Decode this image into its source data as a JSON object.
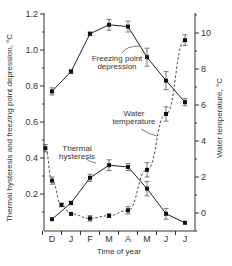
{
  "chart_data": {
    "type": "line",
    "title": "",
    "xlabel": "Time of year",
    "ylabel_left": "Thermal hysteresis and freezing point depression, °C",
    "ylabel_right": "Water temperature, °C",
    "categories": [
      "D",
      "J",
      "F",
      "M",
      "A",
      "M",
      "J",
      "J"
    ],
    "ylim_left": [
      0,
      1.2
    ],
    "ylim_right": [
      -1,
      11
    ],
    "left_ticks": [
      "1.2",
      "1.0",
      "0.8",
      "0.6",
      "0.4",
      "0.2"
    ],
    "right_ticks": [
      "10",
      "8",
      "6",
      "4",
      "2",
      "0"
    ],
    "grid": false,
    "series": [
      {
        "name": "Freezing point depression",
        "axis": "left",
        "style": "solid",
        "x": [
          0,
          1,
          2,
          3,
          4,
          5,
          6,
          7
        ],
        "values": [
          0.77,
          0.88,
          1.09,
          1.14,
          1.13,
          0.96,
          0.83,
          0.71
        ],
        "errors": [
          0.02,
          0.01,
          0.01,
          0.03,
          0.03,
          0.05,
          0.05,
          0.02
        ]
      },
      {
        "name": "Thermal hysteresis",
        "axis": "left",
        "style": "solid",
        "x": [
          0,
          1,
          2,
          3,
          4,
          5,
          6,
          7
        ],
        "values": [
          0.06,
          0.15,
          0.29,
          0.36,
          0.35,
          0.23,
          0.09,
          0.04
        ],
        "errors": [
          0.0,
          0.01,
          0.02,
          0.03,
          0.02,
          0.04,
          0.03,
          0.0
        ]
      },
      {
        "name": "Water temperature",
        "axis": "right",
        "style": "dashed",
        "x": [
          -0.35,
          0,
          0.5,
          1,
          2,
          3,
          4,
          5,
          6,
          7
        ],
        "values": [
          3.6,
          1.8,
          0.45,
          -0.05,
          -0.3,
          -0.15,
          0.15,
          2.4,
          5.5,
          9.6
        ],
        "errors": [
          0.2,
          0.2,
          0.1,
          0.0,
          0.15,
          0.1,
          0.2,
          0.4,
          0.4,
          0.3
        ]
      }
    ],
    "annotations": [
      {
        "text_lines": [
          "Freezing point",
          "depression"
        ],
        "x": 117,
        "y": 61
      },
      {
        "text_lines": [
          "Water",
          "temperature"
        ],
        "x": 134,
        "y": 116
      },
      {
        "text_lines": [
          "Thermal",
          "hysteresis"
        ],
        "x": 77,
        "y": 151
      }
    ]
  }
}
